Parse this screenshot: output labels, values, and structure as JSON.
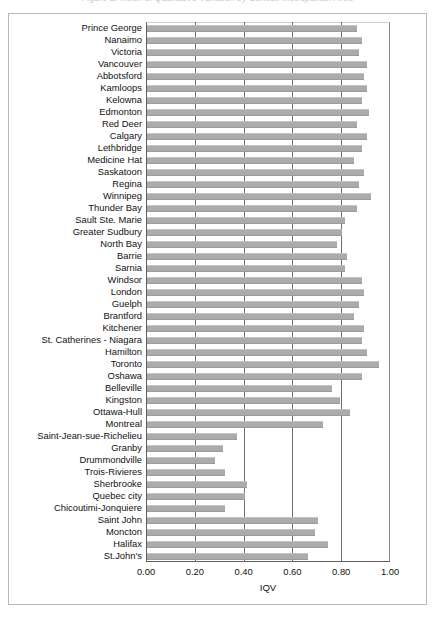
{
  "caption": "Figure 1. Index of Qualitative Variation by Census Metropolitan Area",
  "chart_data": {
    "type": "bar",
    "orientation": "horizontal",
    "title": "",
    "xlabel": "IQV",
    "ylabel": "",
    "xlim": [
      0.0,
      1.0
    ],
    "xticks": [
      "0.00",
      "0.20",
      "0.40",
      "0.60",
      "0.80",
      "1.00"
    ],
    "xtick_values": [
      0.0,
      0.2,
      0.4,
      0.6,
      0.8,
      1.0
    ],
    "grid": true,
    "legend": false,
    "bar_color": "#ababab",
    "axis_color": "#5d5d5d",
    "categories": [
      "Prince George",
      "Nanaimo",
      "Victoria",
      "Vancouver",
      "Abbotsford",
      "Kamloops",
      "Kelowna",
      "Edmonton",
      "Red Deer",
      "Calgary",
      "Lethbridge",
      "Medicine Hat",
      "Saskatoon",
      "Regina",
      "Winnipeg",
      "Thunder Bay",
      "Sault Ste. Marie",
      "Greater Sudbury",
      "North Bay",
      "Barrie",
      "Sarnia",
      "Windsor",
      "London",
      "Guelph",
      "Brantford",
      "Kitchener",
      "St. Catherines - Niagara",
      "Hamilton",
      "Toronto",
      "Oshawa",
      "Belleville",
      "Kingston",
      "Ottawa-Hull",
      "Montreal",
      "Saint-Jean-sue-Richelieu",
      "Granby",
      "Drummondville",
      "Trois-Rivieres",
      "Sherbrooke",
      "Quebec city",
      "Chicoutimi-Jonquiere",
      "Saint John",
      "Moncton",
      "Halifax",
      "St.John's"
    ],
    "values": [
      0.86,
      0.88,
      0.87,
      0.9,
      0.89,
      0.9,
      0.88,
      0.91,
      0.86,
      0.9,
      0.88,
      0.85,
      0.89,
      0.87,
      0.92,
      0.86,
      0.81,
      0.8,
      0.78,
      0.82,
      0.81,
      0.88,
      0.89,
      0.87,
      0.85,
      0.89,
      0.88,
      0.9,
      0.95,
      0.88,
      0.76,
      0.79,
      0.83,
      0.72,
      0.37,
      0.31,
      0.28,
      0.32,
      0.41,
      0.4,
      0.32,
      0.7,
      0.69,
      0.74,
      0.66
    ]
  }
}
